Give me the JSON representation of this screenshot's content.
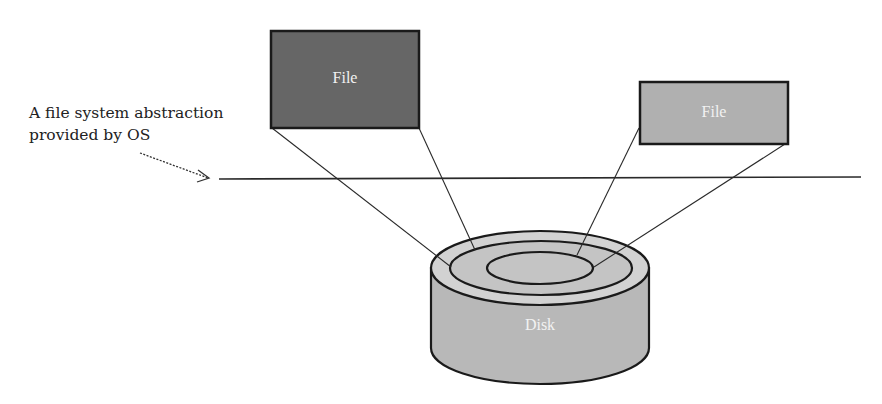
{
  "annotation": {
    "line1": "A file system abstraction",
    "line2": "provided by OS"
  },
  "files": [
    {
      "label": "File",
      "fill": "#666666",
      "x": 270,
      "y": 30,
      "w": 150,
      "h": 98
    },
    {
      "label": "File",
      "fill": "#b0b0b0",
      "x": 639,
      "y": 81,
      "w": 150,
      "h": 63
    }
  ],
  "disk": {
    "label": "Disk",
    "side_fill": "#b8b8b8",
    "top_fill": "#d0d0d0",
    "ring_fill": "#c4c4c4",
    "inner_fill": "#c4c4c4"
  },
  "colors": {
    "stroke": "#1a1a1a",
    "text": "#222222"
  }
}
